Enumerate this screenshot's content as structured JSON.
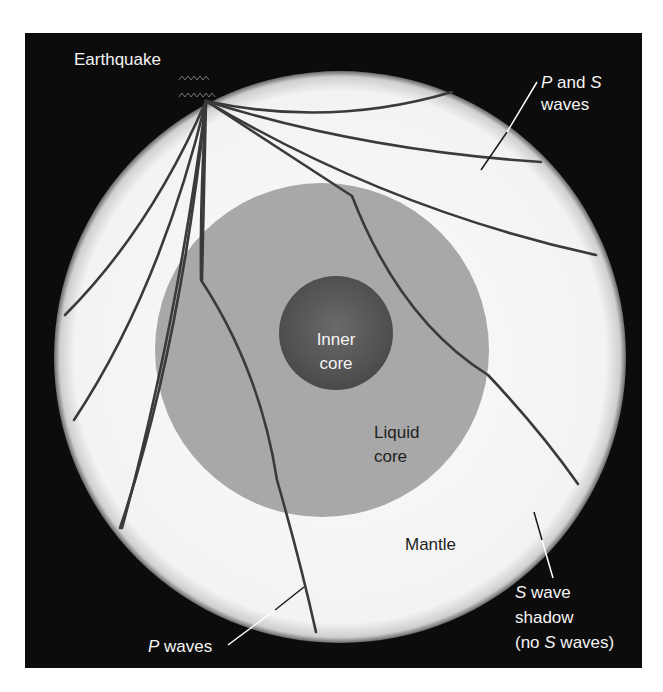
{
  "diagram": {
    "colors": {
      "background": "#0c0c0c",
      "mantle": "#f7f7f7",
      "liquid_core": "#a6a6a6",
      "inner_core": "#555555",
      "wave_path": "#3a3a3a",
      "pointer_on_dark": "#ffffff",
      "pointer_on_light": "#1a1a1a"
    },
    "labels": {
      "earthquake": "Earthquake",
      "p_and_s_waves": {
        "p": "P",
        "and": " and ",
        "s": "S",
        "line2": "waves"
      },
      "inner_core": {
        "line1": "Inner",
        "line2": "core"
      },
      "liquid_core": {
        "line1": "Liquid",
        "line2": "core"
      },
      "mantle": "Mantle",
      "p_waves": {
        "p": "P",
        "rest": " waves"
      },
      "s_wave_shadow": {
        "s": "S",
        "line1_rest": " wave",
        "line2": "shadow",
        "line3_pre": "(no ",
        "line3_s": "S",
        "line3_post": " waves)"
      }
    },
    "regions": [
      {
        "name": "Mantle",
        "shade": "white"
      },
      {
        "name": "Liquid core",
        "shade": "medium gray"
      },
      {
        "name": "Inner core",
        "shade": "dark gray"
      }
    ],
    "wave_paths_count": 10,
    "focus_label": "Earthquake"
  }
}
